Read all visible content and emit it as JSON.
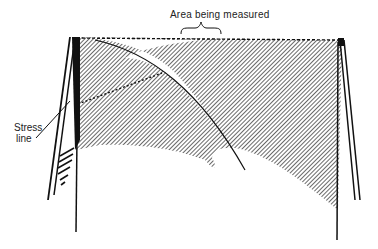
{
  "diagram": {
    "type": "technical illustration",
    "labels": {
      "area_measured": "Area being measured",
      "stress_line_1": "Stress",
      "stress_line_2": "line"
    },
    "colors": {
      "ink": "#111111",
      "hatch_fill": "#7a7a7a",
      "background": "#ffffff"
    }
  }
}
